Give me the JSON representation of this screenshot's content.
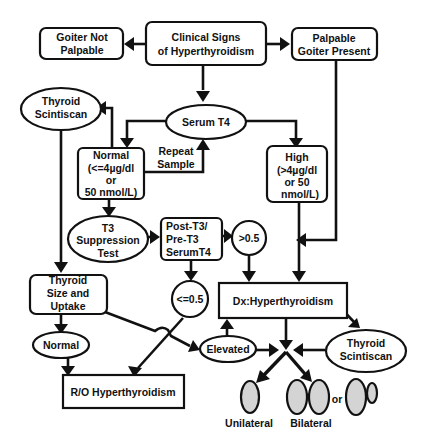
{
  "diagram": {
    "title_node": {
      "line1": "Clinical Signs",
      "line2": "of Hyperthyroidism"
    },
    "goiter_not_palpable": {
      "line1": "Goiter Not",
      "line2": "Palpable"
    },
    "palpable_goiter": {
      "line1": "Palpable",
      "line2": "Goiter Present"
    },
    "thyroid_scintiscan_left": {
      "line1": "Thyroid",
      "line2": "Scintiscan"
    },
    "serum_t4": {
      "label": "Serum T4"
    },
    "normal_t4": {
      "line1": "Normal",
      "line2": "(<=4µg/dl",
      "line3": "or",
      "line4": "50  nmol/L)"
    },
    "repeat_sample": {
      "line1": "Repeat",
      "line2": "Sample"
    },
    "high_t4": {
      "line1": "High",
      "line2": "(>4µg/dl",
      "line3": "or 50",
      "line4": "nmol/L)"
    },
    "t3_suppression": {
      "line1": "T3",
      "line2": "Suppression",
      "line3": "Test"
    },
    "post_pre_ratio": {
      "line1": "Post-T3/",
      "line2": "Pre-T3",
      "line3": "SerumT4"
    },
    "ratio_high": {
      "label": ">0.5"
    },
    "ratio_low": {
      "label": "<=0.5"
    },
    "thyroid_size_uptake": {
      "line1": "Thyroid",
      "line2": "Size and",
      "line3": "Uptake"
    },
    "uptake_normal": {
      "label": "Normal"
    },
    "uptake_elevated": {
      "label": "Elevated"
    },
    "dx_hyperthyroidism": {
      "label": "Dx:Hyperthyroidism"
    },
    "ro_hyperthyroidism": {
      "label": "R/O  Hyperthyroidism"
    },
    "thyroid_scintiscan_right": {
      "line1": "Thyroid",
      "line2": "Scintiscan"
    },
    "unilateral": {
      "label": "Unilateral"
    },
    "bilateral": {
      "label": "Bilateral"
    },
    "or_label": {
      "label": "or"
    },
    "colors": {
      "ink": "#111111",
      "lobe_fill": "#d4d4d4",
      "background": "#ffffff"
    }
  }
}
